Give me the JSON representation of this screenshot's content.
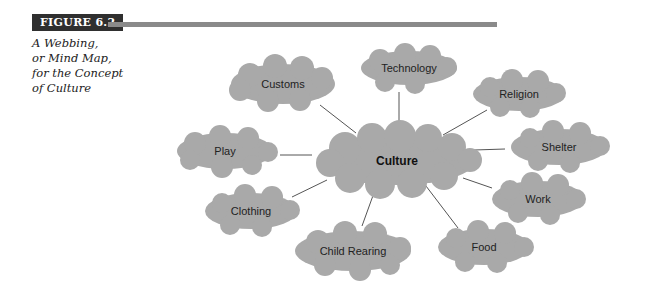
{
  "figure": {
    "label": "FIGURE 6.2",
    "caption_lines": [
      "A Webbing,",
      "or Mind Map,",
      "for the Concept",
      "of Culture"
    ]
  },
  "colors": {
    "cloud": "#a9a9a9",
    "line": "#555555",
    "label_bg": "#2f2f2f",
    "rule": "#8a8a8a"
  },
  "diagram": {
    "center": {
      "label": "Culture",
      "x": 397,
      "y": 161
    },
    "nodes": [
      {
        "label": "Customs",
        "x": 283,
        "y": 84
      },
      {
        "label": "Technology",
        "x": 409,
        "y": 68
      },
      {
        "label": "Religion",
        "x": 519,
        "y": 94
      },
      {
        "label": "Play",
        "x": 225,
        "y": 151
      },
      {
        "label": "Shelter",
        "x": 559,
        "y": 147
      },
      {
        "label": "Work",
        "x": 538,
        "y": 199
      },
      {
        "label": "Clothing",
        "x": 251,
        "y": 211
      },
      {
        "label": "Child Rearing",
        "x": 353,
        "y": 251
      },
      {
        "label": "Food",
        "x": 484,
        "y": 247
      }
    ]
  }
}
